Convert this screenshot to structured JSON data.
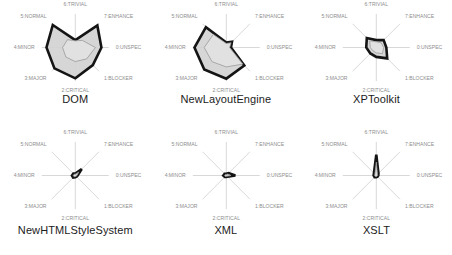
{
  "figure": {
    "kind": "small-multiples-radar-grid",
    "rows": 2,
    "columns": 3,
    "background_color": "#ffffff",
    "axis_line_color": "#b8b8b8",
    "axis_label_color": "#8d8d8d",
    "title_color": "#1b1b1b"
  },
  "axes": [
    {
      "index": 0,
      "label": "0:UNSPEC",
      "angle_deg": 0
    },
    {
      "index": 1,
      "label": "1:BLOCKER",
      "angle_deg": 45
    },
    {
      "index": 2,
      "label": "2:CRITICAL",
      "angle_deg": 90
    },
    {
      "index": 3,
      "label": "3:MAJOR",
      "angle_deg": 135
    },
    {
      "index": 4,
      "label": "4:MINOR",
      "angle_deg": 180
    },
    {
      "index": 5,
      "label": "5:NORMAL",
      "angle_deg": 225
    },
    {
      "index": 6,
      "label": "6:TRIVIAL",
      "angle_deg": 270
    },
    {
      "index": 7,
      "label": "7:ENHANCE",
      "angle_deg": 315
    }
  ],
  "series_style": {
    "outer": {
      "name": "outer-series",
      "stroke": "#141414",
      "stroke_width": 2.6,
      "fill": "#d2d2d2"
    },
    "inner": {
      "name": "inner-series",
      "stroke": "#9a9a9a",
      "stroke_width": 0.8,
      "fill": "#e2e2e2"
    }
  },
  "chart_data": [
    {
      "type": "radar",
      "title": "DOM",
      "categories": [
        "0:UNSPEC",
        "1:BLOCKER",
        "2:CRITICAL",
        "3:MAJOR",
        "4:MINOR",
        "5:NORMAL",
        "6:TRIVIAL",
        "7:ENHANCE"
      ],
      "rlim": [
        0,
        1
      ],
      "grid": false,
      "legend": "none",
      "series": [
        {
          "name": "outer-series",
          "values": [
            0.78,
            0.74,
            0.92,
            0.88,
            0.86,
            0.95,
            0.22,
            0.93
          ]
        },
        {
          "name": "inner-series",
          "values": [
            0.6,
            0.48,
            0.42,
            0.4,
            0.38,
            0.33,
            0.2,
            0.3
          ]
        }
      ]
    },
    {
      "type": "radar",
      "title": "NewLayoutEngine",
      "categories": [
        "0:UNSPEC",
        "1:BLOCKER",
        "2:CRITICAL",
        "3:MAJOR",
        "4:MINOR",
        "5:NORMAL",
        "6:TRIVIAL",
        "7:ENHANCE"
      ],
      "rlim": [
        0,
        1
      ],
      "grid": false,
      "legend": "none",
      "series": [
        {
          "name": "outer-series",
          "values": [
            0.14,
            0.76,
            0.93,
            0.93,
            0.95,
            0.86,
            0.15,
            0.24
          ]
        },
        {
          "name": "inner-series",
          "values": [
            0.1,
            0.7,
            0.58,
            0.6,
            0.66,
            0.55,
            0.12,
            0.2
          ]
        }
      ]
    },
    {
      "type": "radar",
      "title": "XPToolkit",
      "categories": [
        "0:UNSPEC",
        "1:BLOCKER",
        "2:CRITICAL",
        "3:MAJOR",
        "4:MINOR",
        "5:NORMAL",
        "6:TRIVIAL",
        "7:ENHANCE"
      ],
      "rlim": [
        0,
        1
      ],
      "grid": false,
      "legend": "none",
      "series": [
        {
          "name": "outer-series",
          "values": [
            0.3,
            0.46,
            0.28,
            0.25,
            0.3,
            0.4,
            0.22,
            0.31
          ]
        },
        {
          "name": "inner-series",
          "values": [
            0.22,
            0.26,
            0.16,
            0.14,
            0.18,
            0.28,
            0.17,
            0.2
          ]
        }
      ]
    },
    {
      "type": "radar",
      "title": "NewHTMLStyleSystem",
      "categories": [
        "0:UNSPEC",
        "1:BLOCKER",
        "2:CRITICAL",
        "3:MAJOR",
        "4:MINOR",
        "5:NORMAL",
        "6:TRIVIAL",
        "7:ENHANCE"
      ],
      "rlim": [
        0,
        1
      ],
      "grid": false,
      "legend": "none",
      "series": [
        {
          "name": "outer-series",
          "values": [
            0.07,
            0.05,
            0.05,
            0.09,
            0.1,
            0.08,
            0.06,
            0.27
          ]
        },
        {
          "name": "inner-series",
          "values": [
            0.05,
            0.03,
            0.03,
            0.05,
            0.06,
            0.05,
            0.04,
            0.14
          ]
        }
      ]
    },
    {
      "type": "radar",
      "title": "XML",
      "categories": [
        "0:UNSPEC",
        "1:BLOCKER",
        "2:CRITICAL",
        "3:MAJOR",
        "4:MINOR",
        "5:NORMAL",
        "6:TRIVIAL",
        "7:ENHANCE"
      ],
      "rlim": [
        0,
        1
      ],
      "grid": false,
      "legend": "none",
      "series": [
        {
          "name": "outer-series",
          "values": [
            0.27,
            0.05,
            0.04,
            0.06,
            0.09,
            0.07,
            0.05,
            0.1
          ]
        },
        {
          "name": "inner-series",
          "values": [
            0.14,
            0.03,
            0.02,
            0.04,
            0.05,
            0.04,
            0.03,
            0.06
          ]
        }
      ]
    },
    {
      "type": "radar",
      "title": "XSLT",
      "categories": [
        "0:UNSPEC",
        "1:BLOCKER",
        "2:CRITICAL",
        "3:MAJOR",
        "4:MINOR",
        "5:NORMAL",
        "6:TRIVIAL",
        "7:ENHANCE"
      ],
      "rlim": [
        0,
        1
      ],
      "grid": false,
      "legend": "none",
      "series": [
        {
          "name": "outer-series",
          "values": [
            0.06,
            0.05,
            0.05,
            0.07,
            0.08,
            0.1,
            0.62,
            0.09
          ]
        },
        {
          "name": "inner-series",
          "values": [
            0.04,
            0.03,
            0.03,
            0.04,
            0.05,
            0.06,
            0.4,
            0.05
          ]
        }
      ]
    }
  ]
}
